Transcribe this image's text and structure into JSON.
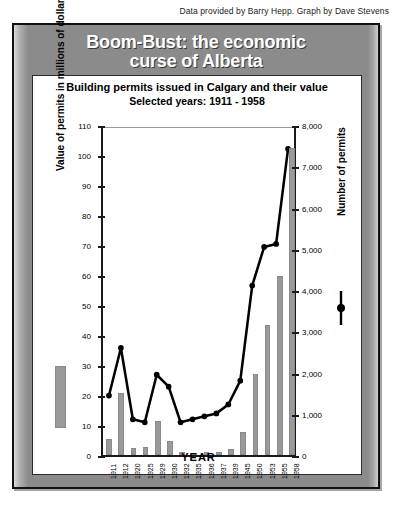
{
  "credit": "Data provided by Barry Hepp. Graph by Dave Stevens",
  "header": {
    "title_line1": "Boom-Bust: the economic",
    "title_line2": "curse of Alberta"
  },
  "colors": {
    "panel": "#8b8b8b",
    "bar": "#9a9a9a",
    "line": "#000000",
    "card": "#ffffff",
    "axis": "#1a1a1a"
  },
  "chart_data": {
    "type": "bar",
    "title": "Building permits issued in Calgary and their value",
    "subtitle": "Selected years: 1911 - 1958",
    "xlabel": "YEAR",
    "ylabel": "Value of permits in millions of dollars",
    "y2label": "Number of permits",
    "grid": false,
    "legend_position": "outside-left-and-right",
    "ylim": [
      0,
      110
    ],
    "y2lim": [
      0,
      8000
    ],
    "yticks": [
      "0",
      "10",
      "20",
      "30",
      "40",
      "50",
      "60",
      "70",
      "80",
      "90",
      "100",
      "110"
    ],
    "y2ticks": [
      "0",
      "1,000",
      "2,000",
      "3,000",
      "4,000",
      "5,000",
      "6,000",
      "7,000",
      "8,000"
    ],
    "categories": [
      "1911",
      "1912",
      "1920",
      "1925",
      "1929",
      "1930",
      "1932",
      "1935",
      "1936",
      "1937",
      "1939",
      "1945",
      "1950",
      "1953",
      "1955",
      "1958"
    ],
    "series": [
      {
        "name": "Value of permits in millions of dollars",
        "kind": "bar",
        "axis": "right",
        "unit": "permits",
        "values": [
          400,
          1500,
          180,
          200,
          820,
          340,
          70,
          60,
          75,
          80,
          140,
          570,
          1960,
          3150,
          4350,
          7450
        ]
      },
      {
        "name": "Number of permits",
        "kind": "line",
        "axis": "left",
        "unit": "millions of dollars",
        "values": [
          20,
          36,
          12,
          11,
          27,
          23,
          11,
          12,
          13,
          14,
          17,
          25,
          57,
          70,
          71,
          103
        ]
      }
    ]
  }
}
